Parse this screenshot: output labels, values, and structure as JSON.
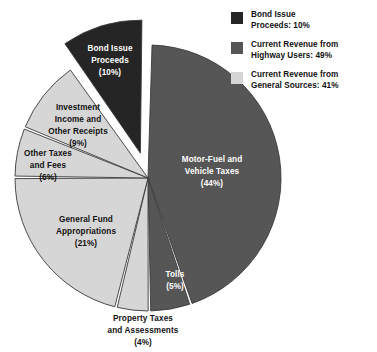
{
  "chart_data": {
    "type": "pie",
    "title": "",
    "subtitle": "",
    "xlabel": "",
    "ylabel": "",
    "grid": false,
    "legend_position": "top-right",
    "units": "percent",
    "total": 100,
    "categories": [
      "Motor-Fuel and Vehicle Taxes",
      "Tolls",
      "Property Taxes and Assessments",
      "General Fund Appropriations",
      "Other Taxes and Fees",
      "Investment Income and Other Receipts",
      "Bond Issue Proceeds"
    ],
    "values": [
      44,
      5,
      4,
      21,
      6,
      9,
      10
    ],
    "slices": [
      {
        "key": "motor-fuel-and-vehicle-taxes",
        "label_line1": "Motor-Fuel and",
        "label_line2": "Vehicle Taxes",
        "label_value": "(44%)",
        "value": 44,
        "color": "#565656",
        "group": "Current Revenue from Highway Users",
        "exploded": false,
        "label_placement": "inside",
        "label_color": "white"
      },
      {
        "key": "tolls",
        "label_line1": "Tolls",
        "label_line2": "",
        "label_value": "(5%)",
        "value": 5,
        "color": "#565656",
        "group": "Current Revenue from Highway Users",
        "exploded": false,
        "label_placement": "inside",
        "label_color": "white"
      },
      {
        "key": "property-taxes-and-assessments",
        "label_line1": "Property Taxes",
        "label_line2": "and Assessments",
        "label_value": "(4%)",
        "value": 4,
        "color": "#d6d6d6",
        "group": "Current Revenue from General Sources",
        "exploded": false,
        "label_placement": "outside-bottom",
        "label_color": "black"
      },
      {
        "key": "general-fund-appropriations",
        "label_line1": "General Fund",
        "label_line2": "Appropriations",
        "label_value": "(21%)",
        "value": 21,
        "color": "#d6d6d6",
        "group": "Current Revenue from General Sources",
        "exploded": false,
        "label_placement": "inside",
        "label_color": "black"
      },
      {
        "key": "other-taxes-and-fees",
        "label_line1": "Other Taxes",
        "label_line2": "and Fees",
        "label_value": "(6%)",
        "value": 6,
        "color": "#d6d6d6",
        "group": "Current Revenue from General Sources",
        "exploded": false,
        "label_placement": "inside",
        "label_color": "black"
      },
      {
        "key": "investment-income-and-other-receipts",
        "label_line1": "Investment",
        "label_line2": "Income and",
        "label_line3": "Other Receipts",
        "label_value": "(9%)",
        "value": 9,
        "color": "#d6d6d6",
        "group": "Current Revenue from General Sources",
        "exploded": false,
        "label_placement": "inside",
        "label_color": "black"
      },
      {
        "key": "bond-issue-proceeds",
        "label_line1": "Bond Issue",
        "label_line2": "Proceeds",
        "label_value": "(10%)",
        "value": 10,
        "color": "#252525",
        "group": "Bond Issue Proceeds",
        "exploded": true,
        "label_placement": "inside",
        "label_color": "white"
      }
    ],
    "legend": [
      {
        "key": "bond-issue-proceeds",
        "line1": "Bond Issue",
        "line2": "Proceeds: 10%",
        "color": "#252525",
        "value": 10
      },
      {
        "key": "current-revenue-from-highway-users",
        "line1": "Current Revenue from",
        "line2": "Highway Users: 49%",
        "color": "#565656",
        "value": 49
      },
      {
        "key": "current-revenue-from-general-sources",
        "line1": "Current Revenue from",
        "line2": "General Sources: 41%",
        "color": "#d6d6d6",
        "value": 41
      }
    ],
    "colors": {
      "dark": "#252525",
      "medium": "#565656",
      "light": "#d6d6d6",
      "outline": "#3a3a3a",
      "background": "#ffffff",
      "text": "#111111",
      "text_on_dark": "#ffffff"
    }
  }
}
